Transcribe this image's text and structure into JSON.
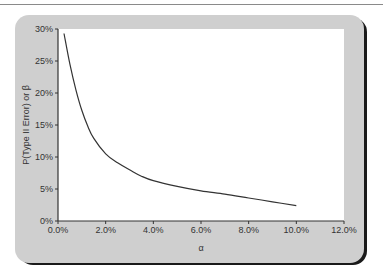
{
  "chart_data": {
    "type": "line",
    "title": "",
    "xlabel": "α",
    "ylabel": "P(Type II Error) or β",
    "xlim": [
      0,
      12
    ],
    "ylim": [
      0,
      30
    ],
    "grid": false,
    "legend": null,
    "x_ticks": [
      "0.0%",
      "2.0%",
      "4.0%",
      "6.0%",
      "8.0%",
      "10.0%",
      "12.0%"
    ],
    "y_ticks": [
      "0%",
      "5%",
      "10%",
      "15%",
      "20%",
      "25%",
      "30%"
    ],
    "series": [
      {
        "name": "β vs α",
        "color": "#333333",
        "x": [
          0.25,
          0.5,
          0.75,
          1.0,
          1.25,
          1.5,
          2.0,
          2.5,
          3.0,
          3.5,
          4.0,
          5.0,
          6.0,
          7.0,
          8.0,
          9.0,
          10.0
        ],
        "y": [
          29.3,
          24.5,
          20.5,
          17.3,
          14.8,
          12.9,
          10.5,
          9.1,
          8.0,
          7.0,
          6.3,
          5.4,
          4.7,
          4.2,
          3.6,
          3.0,
          2.4
        ]
      }
    ]
  },
  "axes": {
    "x_title": "α",
    "y_title": "P(Type II Error) or β"
  }
}
